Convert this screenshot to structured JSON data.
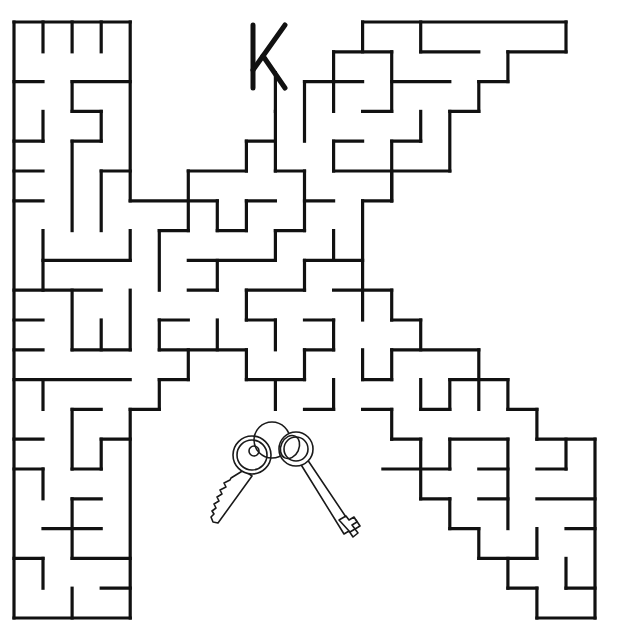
{
  "puzzle": {
    "title": "Letter K Maze",
    "letter": "K",
    "goal_label": "Keys",
    "colors": {
      "ink": "#111111",
      "background": "#ffffff"
    },
    "grid": {
      "origin_x": 14,
      "origin_y": 22,
      "step_x": 29.05,
      "step_y": 29.8,
      "cols": 20,
      "rows": 20
    },
    "walls": [
      [
        0,
        0,
        4,
        0
      ],
      [
        1,
        0,
        1,
        1
      ],
      [
        2,
        0,
        2,
        1
      ],
      [
        3,
        0,
        3,
        1
      ],
      [
        0,
        0,
        0,
        20
      ],
      [
        4,
        0,
        4,
        6
      ],
      [
        0,
        2,
        1,
        2
      ],
      [
        2,
        2,
        4,
        2
      ],
      [
        2,
        2,
        2,
        3
      ],
      [
        2,
        3,
        3,
        3
      ],
      [
        3,
        3,
        3,
        4
      ],
      [
        2,
        4,
        3,
        4
      ],
      [
        2,
        4,
        2,
        7
      ],
      [
        1,
        3,
        1,
        4
      ],
      [
        0,
        4,
        1,
        4
      ],
      [
        0,
        5,
        1,
        5
      ],
      [
        3,
        5,
        4,
        5
      ],
      [
        3,
        5,
        3,
        7
      ],
      [
        0,
        6,
        1,
        6
      ],
      [
        4,
        6,
        7,
        6
      ],
      [
        7,
        6,
        7,
        7
      ],
      [
        7,
        7,
        8,
        7
      ],
      [
        8,
        6,
        8,
        7
      ],
      [
        8,
        6,
        9,
        6
      ],
      [
        6,
        5,
        8,
        5
      ],
      [
        6,
        5,
        6,
        7
      ],
      [
        5,
        7,
        6,
        7
      ],
      [
        5,
        7,
        5,
        9
      ],
      [
        8,
        4,
        9,
        4
      ],
      [
        8,
        4,
        8,
        5
      ],
      [
        9,
        3,
        9,
        5
      ],
      [
        9,
        5,
        10,
        5
      ],
      [
        10,
        5,
        10,
        7
      ],
      [
        1,
        7,
        1,
        9
      ],
      [
        4,
        7,
        4,
        8
      ],
      [
        1,
        8,
        4,
        8
      ],
      [
        0,
        9,
        3,
        9
      ],
      [
        2,
        9,
        2,
        11
      ],
      [
        4,
        9,
        4,
        11
      ],
      [
        3,
        10,
        3,
        11
      ],
      [
        2,
        11,
        4,
        11
      ],
      [
        0,
        10,
        1,
        10
      ],
      [
        0,
        11,
        1,
        11
      ],
      [
        0,
        12,
        4,
        12
      ],
      [
        1,
        12,
        1,
        13
      ],
      [
        6,
        8,
        9,
        8
      ],
      [
        7,
        8,
        7,
        9
      ],
      [
        6,
        9,
        7,
        9
      ],
      [
        9,
        7,
        10,
        7
      ],
      [
        9,
        7,
        9,
        8
      ],
      [
        10,
        8,
        12,
        8
      ],
      [
        10,
        8,
        10,
        9
      ],
      [
        8,
        9,
        10,
        9
      ],
      [
        8,
        9,
        8,
        10
      ],
      [
        8,
        10,
        9,
        10
      ],
      [
        9,
        10,
        9,
        11
      ],
      [
        11,
        7,
        11,
        8
      ],
      [
        12,
        6,
        12,
        10
      ],
      [
        12,
        6,
        13,
        6
      ],
      [
        13,
        5,
        13,
        6
      ],
      [
        10,
        6,
        11,
        6
      ],
      [
        11,
        9,
        13,
        9
      ],
      [
        13,
        9,
        13,
        10
      ],
      [
        13,
        10,
        14,
        10
      ],
      [
        14,
        10,
        14,
        11
      ],
      [
        13,
        11,
        16,
        11
      ],
      [
        5,
        10,
        6,
        10
      ],
      [
        5,
        10,
        5,
        11
      ],
      [
        5,
        11,
        8,
        11
      ],
      [
        7,
        10,
        7,
        11
      ],
      [
        8,
        11,
        8,
        12
      ],
      [
        8,
        12,
        10,
        12
      ],
      [
        10,
        11,
        10,
        12
      ],
      [
        10,
        11,
        11,
        11
      ],
      [
        11,
        10,
        11,
        11
      ],
      [
        10,
        10,
        11,
        10
      ],
      [
        6,
        11,
        6,
        12
      ],
      [
        5,
        12,
        6,
        12
      ],
      [
        5,
        12,
        5,
        13
      ],
      [
        4,
        13,
        5,
        13
      ],
      [
        4,
        13,
        4,
        20
      ],
      [
        9,
        12,
        9,
        13
      ],
      [
        11,
        12,
        11,
        13
      ],
      [
        10,
        13,
        11,
        13
      ],
      [
        12,
        11,
        12,
        12
      ],
      [
        12,
        12,
        13,
        12
      ],
      [
        13,
        11,
        13,
        12
      ],
      [
        12,
        13,
        13,
        13
      ],
      [
        13,
        13,
        13,
        14
      ],
      [
        13,
        14,
        14,
        14
      ],
      [
        14,
        14,
        14,
        16
      ],
      [
        14,
        12,
        14,
        13
      ],
      [
        14,
        13,
        15,
        13
      ],
      [
        15,
        12,
        15,
        13
      ],
      [
        15,
        12,
        17,
        12
      ],
      [
        16,
        11,
        16,
        13
      ],
      [
        17,
        12,
        17,
        13
      ],
      [
        17,
        13,
        18,
        13
      ],
      [
        18,
        13,
        18,
        14
      ],
      [
        18,
        14,
        20,
        14
      ],
      [
        15,
        14,
        17,
        14
      ],
      [
        15,
        14,
        15,
        15
      ],
      [
        12.7,
        15,
        15,
        15
      ],
      [
        16,
        15,
        17,
        15
      ],
      [
        17,
        14,
        17,
        17
      ],
      [
        16,
        16,
        17,
        16
      ],
      [
        14,
        16,
        15,
        16
      ],
      [
        15,
        16,
        15,
        17
      ],
      [
        15,
        17,
        16,
        17
      ],
      [
        16,
        17,
        16,
        18
      ],
      [
        16,
        18,
        18,
        18
      ],
      [
        18,
        17,
        18,
        18
      ],
      [
        17,
        18,
        17,
        19
      ],
      [
        17,
        19,
        18,
        19
      ],
      [
        18,
        19,
        18,
        20
      ],
      [
        18,
        20,
        20,
        20
      ],
      [
        20,
        14,
        20,
        20
      ],
      [
        19,
        14,
        19,
        15
      ],
      [
        18,
        15,
        19,
        15
      ],
      [
        18,
        16,
        20,
        16
      ],
      [
        19,
        17,
        20,
        17
      ],
      [
        19,
        18,
        19,
        19
      ],
      [
        19,
        19,
        20,
        19
      ],
      [
        2,
        13,
        3,
        13
      ],
      [
        2,
        13,
        2,
        15
      ],
      [
        3,
        14,
        4,
        14
      ],
      [
        3,
        14,
        3,
        15
      ],
      [
        2,
        15,
        3,
        15
      ],
      [
        0,
        14,
        1,
        14
      ],
      [
        0,
        15,
        1,
        15
      ],
      [
        1,
        15,
        1,
        16
      ],
      [
        2,
        16,
        3,
        16
      ],
      [
        2,
        16,
        2,
        18
      ],
      [
        1,
        17,
        3,
        17
      ],
      [
        2,
        18,
        4,
        18
      ],
      [
        0,
        18,
        1,
        18
      ],
      [
        1,
        18,
        1,
        19
      ],
      [
        2,
        19,
        2,
        20
      ],
      [
        3,
        19,
        4,
        19
      ],
      [
        0,
        20,
        4,
        20
      ],
      [
        12,
        0,
        19,
        0
      ],
      [
        19,
        0,
        19,
        1
      ],
      [
        17,
        1,
        19,
        1
      ],
      [
        12,
        0,
        12,
        1
      ],
      [
        14,
        0,
        14,
        1
      ],
      [
        14,
        1,
        16,
        1
      ],
      [
        11,
        1,
        13,
        1
      ],
      [
        11,
        1,
        11,
        3
      ],
      [
        13,
        1,
        13,
        3
      ],
      [
        12,
        3,
        13,
        3
      ],
      [
        10,
        2,
        12,
        2
      ],
      [
        10,
        2,
        10,
        4
      ],
      [
        13,
        2,
        15,
        2
      ],
      [
        17,
        1,
        17,
        2
      ],
      [
        16,
        2,
        17,
        2
      ],
      [
        16,
        2,
        16,
        3
      ],
      [
        15,
        3,
        16,
        3
      ],
      [
        15,
        3,
        15,
        5
      ],
      [
        11,
        5,
        15,
        5
      ],
      [
        14,
        3,
        14,
        4
      ],
      [
        13,
        4,
        14,
        4
      ],
      [
        13,
        4,
        13,
        6
      ],
      [
        11,
        4,
        12,
        4
      ],
      [
        11,
        4,
        11,
        5
      ],
      [
        9,
        1.7,
        9,
        3
      ]
    ]
  }
}
